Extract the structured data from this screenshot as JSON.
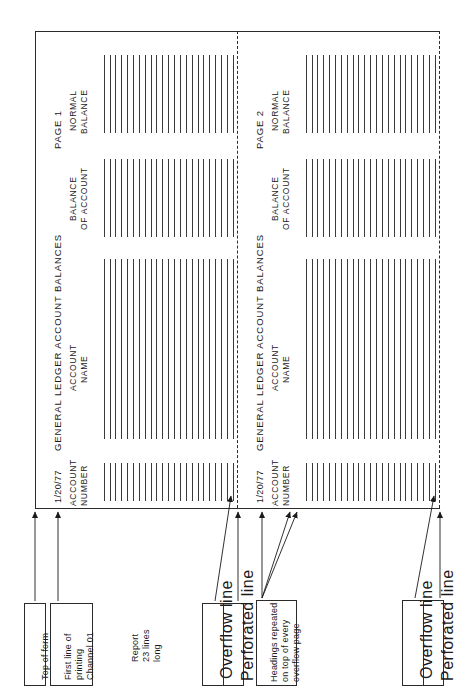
{
  "diagram": {
    "orientation": "text rotated 90 degrees counter-clockwise"
  },
  "form": {
    "pages": [
      {
        "page_label": "PAGE 1",
        "report_title": "GENERAL LEDGER ACCOUNT BALANCES",
        "date": "1/20/77",
        "columns": [
          {
            "line1": "ACCOUNT",
            "line2": "NUMBER"
          },
          {
            "line1": "ACCOUNT",
            "line2": "NAME"
          },
          {
            "line1": "BALANCE",
            "line2": "OF ACCOUNT"
          },
          {
            "line1": "NORMAL",
            "line2": "BALANCE"
          }
        ],
        "detail_line_count": 23
      },
      {
        "page_label": "PAGE 2",
        "report_title": "GENERAL LEDGER ACCOUNT BALANCES",
        "date": "1/20/77",
        "columns": [
          {
            "line1": "ACCOUNT",
            "line2": "NUMBER"
          },
          {
            "line1": "ACCOUNT",
            "line2": "NAME"
          },
          {
            "line1": "BALANCE",
            "line2": "OF ACCOUNT"
          },
          {
            "line1": "NORMAL",
            "line2": "BALANCE"
          }
        ],
        "detail_line_count": 23
      }
    ]
  },
  "annotations": {
    "top_of_form": "Top of form",
    "first_line_of_printing": "First line of\nprinting\nChannel 01",
    "first_line_of_printing_l1": "First line of",
    "first_line_of_printing_l2": "printing",
    "first_line_of_printing_l3": "Channel 01",
    "report_length_l1": "Report",
    "report_length_l2": "23 lines",
    "report_length_l3": "long",
    "overflow_line": "Overflow line",
    "perforated_line": "Perforated line",
    "headings_repeated_l1": "Headings repeated",
    "headings_repeated_l2": "on top of every",
    "headings_repeated_l3": "overflow page",
    "overflow_line_2": "Overflow line",
    "perforated_line_2": "Perforated line"
  },
  "colors": {
    "ink": "#1a1a1a",
    "rule": "#2b2b2b",
    "stroke": "#3a3a3a",
    "paper": "#ffffff"
  }
}
